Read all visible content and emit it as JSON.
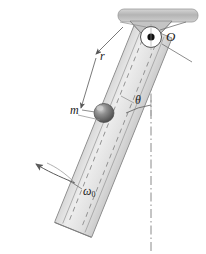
{
  "figure": {
    "background_color": "#ffffff",
    "labels": {
      "pivot": "O",
      "radius": "r",
      "mass": "m",
      "angle": "θ",
      "angular_velocity": "ω",
      "angular_velocity_subscript": "0"
    },
    "colors": {
      "ceiling_fill": "#bfbfbf",
      "ceiling_stroke": "#8c8c8c",
      "rod_fill": "#e3e3e3",
      "rod_stroke": "#8a8a8a",
      "bracket_fill": "#c9c9c9",
      "ball_fill": "#707070",
      "ball_highlight": "#c9c9c9",
      "line_stroke": "#555555",
      "centerline_stroke": "#7a7a7a",
      "pivot_dot": "#111111",
      "text": "#1a1a1a"
    },
    "elements": [
      "ceiling-support-bar",
      "pivot-bracket",
      "pivot-circle",
      "pivot-dot",
      "slotted-rod",
      "rod-center-dashes",
      "sliding-mass-ball",
      "radius-dimension-line",
      "angle-arc",
      "vertical-centerline",
      "spin-arrow"
    ]
  }
}
